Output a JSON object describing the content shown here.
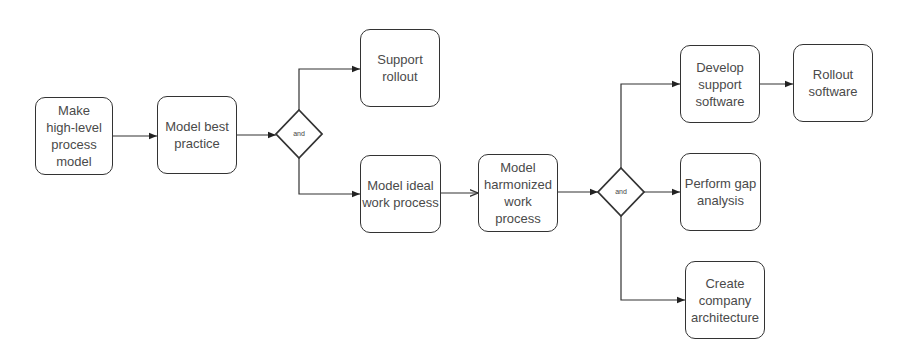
{
  "diagram": {
    "type": "process-flowchart",
    "colors": {
      "stroke": "#333333",
      "text": "#4a4a4a",
      "background": "#ffffff"
    },
    "nodes": [
      {
        "id": "n1",
        "label": "Make high-level process model",
        "x": 35,
        "y": 97,
        "w": 78,
        "h": 78
      },
      {
        "id": "n2",
        "label": "Model best practice",
        "x": 157,
        "y": 96,
        "w": 80,
        "h": 78
      },
      {
        "id": "n3",
        "label": "Support rollout",
        "x": 360,
        "y": 29,
        "w": 80,
        "h": 78
      },
      {
        "id": "n4",
        "label": "Model ideal work process",
        "x": 360,
        "y": 155,
        "w": 81,
        "h": 78
      },
      {
        "id": "n5",
        "label": "Model harmonized work process",
        "x": 478,
        "y": 154,
        "w": 80,
        "h": 78
      },
      {
        "id": "n6",
        "label": "Develop support software",
        "x": 680,
        "y": 45,
        "w": 80,
        "h": 78
      },
      {
        "id": "n7",
        "label": "Rollout software",
        "x": 793,
        "y": 44,
        "w": 80,
        "h": 78
      },
      {
        "id": "n8",
        "label": "Perform gap analysis",
        "x": 680,
        "y": 153,
        "w": 81,
        "h": 78
      },
      {
        "id": "n9",
        "label": "Create company architecture",
        "x": 685,
        "y": 261,
        "w": 80,
        "h": 78
      }
    ],
    "gateways": [
      {
        "id": "g1",
        "label": "and",
        "cx": 299,
        "cy": 134,
        "rx": 23,
        "ry": 24
      },
      {
        "id": "g2",
        "label": "and",
        "cx": 621,
        "cy": 192,
        "rx": 23,
        "ry": 24
      }
    ],
    "edges": [
      {
        "from": "n1",
        "to": "n2",
        "label": ""
      },
      {
        "from": "n2",
        "to": "g1",
        "label": ""
      },
      {
        "from": "g1",
        "to": "n3",
        "label": ""
      },
      {
        "from": "g1",
        "to": "n4",
        "label": ""
      },
      {
        "from": "n4",
        "to": "n5",
        "label": ""
      },
      {
        "from": "n5",
        "to": "g2",
        "label": ""
      },
      {
        "from": "g2",
        "to": "n6",
        "label": ""
      },
      {
        "from": "n6",
        "to": "n7",
        "label": ""
      },
      {
        "from": "g2",
        "to": "n8",
        "label": ""
      },
      {
        "from": "g2",
        "to": "n9",
        "label": ""
      }
    ]
  }
}
